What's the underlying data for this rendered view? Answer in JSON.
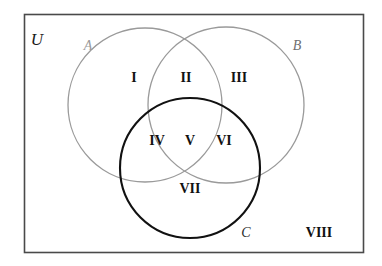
{
  "diagram": {
    "type": "venn-3-set",
    "universe": {
      "label": "U",
      "border_color": "#4a4a4a",
      "fill_color": "#ffffff"
    },
    "sets": [
      {
        "id": "A",
        "label": "A",
        "stroke": "#9a9a9a",
        "cx": 145,
        "cy": 105,
        "r": 77,
        "stroke_width": 1.2
      },
      {
        "id": "B",
        "label": "B",
        "stroke": "#9a9a9a",
        "cx": 226,
        "cy": 105,
        "r": 78,
        "stroke_width": 1.2
      },
      {
        "id": "C",
        "label": "C",
        "stroke": "#111111",
        "cx": 190,
        "cy": 168,
        "r": 70,
        "stroke_width": 2.0
      }
    ],
    "set_label_positions": [
      {
        "id": "A",
        "x": 88,
        "y": 47
      },
      {
        "id": "B",
        "x": 297,
        "y": 47
      },
      {
        "id": "C",
        "x": 246,
        "y": 235
      }
    ],
    "universe_label_position": {
      "x": 37,
      "y": 41
    },
    "regions": [
      {
        "id": "I",
        "label": "I",
        "description": "A only",
        "x": 134,
        "y": 79
      },
      {
        "id": "II",
        "label": "II",
        "description": "A and B only",
        "x": 186,
        "y": 79
      },
      {
        "id": "III",
        "label": "III",
        "description": "B only",
        "x": 238,
        "y": 79
      },
      {
        "id": "IV",
        "label": "IV",
        "description": "A and C only",
        "x": 157,
        "y": 142
      },
      {
        "id": "V",
        "label": "V",
        "description": "A and B and C",
        "x": 190,
        "y": 142
      },
      {
        "id": "VI",
        "label": "VI",
        "description": "B and C only",
        "x": 223,
        "y": 142
      },
      {
        "id": "VII",
        "label": "VII",
        "description": "C only",
        "x": 190,
        "y": 190
      },
      {
        "id": "VIII",
        "label": "VIII",
        "description": "outside A, B and C",
        "x": 319,
        "y": 234
      }
    ],
    "rect": {
      "x": 24,
      "y": 14,
      "width": 340,
      "height": 239
    },
    "fonts": {
      "set_label_size": 15,
      "region_label_size": 14,
      "universe_label_size": 16
    }
  }
}
